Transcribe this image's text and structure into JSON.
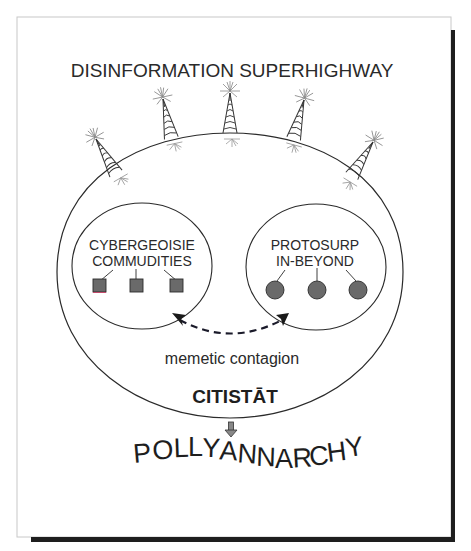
{
  "diagram": {
    "title": "DISINFORMATION SUPERHIGHWAY",
    "outer_region": {
      "label": "CITISTĀT"
    },
    "groups": [
      {
        "line1": "CYBERGEOISIE",
        "line2": "COMMUDITIES",
        "member_shape": "square",
        "member_count": 3
      },
      {
        "line1": "PROTOSURP",
        "line2": "IN-BEYOND",
        "member_shape": "circle",
        "member_count": 3
      }
    ],
    "link": {
      "label": "memetic contagion",
      "style": "dashed bidirectional arrow"
    },
    "outcome": {
      "label": "POLLYANNARCHY",
      "letters": [
        "P",
        "O",
        "L",
        "L",
        "Y",
        "A",
        "N",
        "N",
        "A",
        "R",
        "C",
        "H",
        "Y"
      ]
    },
    "towers": {
      "count": 5,
      "icon": "broadcast-tower-icon"
    },
    "colors": {
      "ink": "#2a2a2a",
      "member_fill": "#6a6a6a",
      "frame_shadow": "#1e1e1e",
      "frame_border": "#c8c8c8",
      "arrow_dash": "#1a1a2a"
    }
  }
}
